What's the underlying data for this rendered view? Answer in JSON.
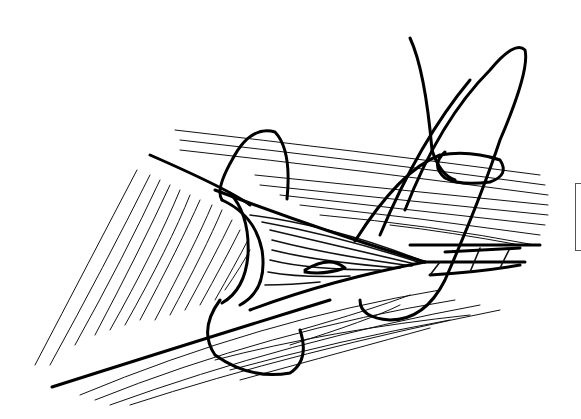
{
  "illustration": {
    "subject": "surgical line drawing: suture loop passing through layered muscle/tissue fibers",
    "colors": {
      "background": "#ffffff",
      "ink": "#000000"
    }
  }
}
